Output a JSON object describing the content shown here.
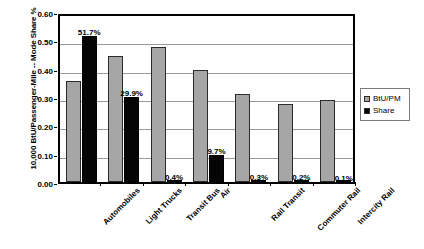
{
  "chart_data": {
    "type": "bar",
    "title": "",
    "xlabel": "",
    "ylabel": "10,000 BtU/Passenger-Mile -- Mode Share %",
    "ylim": [
      0.0,
      0.6
    ],
    "ytick_labels": [
      "0.60",
      "0.50",
      "0.40",
      "0.30",
      "0.20",
      "0.10",
      "0.00"
    ],
    "ytick_values": [
      0.6,
      0.5,
      0.4,
      0.3,
      0.2,
      0.1,
      0.0
    ],
    "grid": true,
    "legend_position": "right",
    "categories": [
      "Automobiles",
      "Light Trucks",
      "Transit Bus",
      "Air",
      "Rail Transit",
      "Commuter Rail",
      "Intercity Rail"
    ],
    "series": [
      {
        "name": "BtU/PM",
        "color": "#a6a6a6",
        "values": [
          0.355,
          0.445,
          0.478,
          0.397,
          0.31,
          0.275,
          0.29
        ],
        "labels": [
          "",
          "",
          "",
          "",
          "",
          "",
          ""
        ]
      },
      {
        "name": "Share",
        "color": "#050505",
        "values": [
          0.517,
          0.299,
          0.004,
          0.097,
          0.003,
          0.002,
          0.001
        ],
        "labels": [
          "51.7%",
          "29.9%",
          "0.4%",
          "9.7%",
          "0.3%",
          "0.2%",
          "0.1%"
        ]
      }
    ]
  },
  "legend": {
    "items": [
      {
        "label": "BtU/PM",
        "swatch": "btu"
      },
      {
        "label": "Share",
        "swatch": "share"
      }
    ]
  }
}
